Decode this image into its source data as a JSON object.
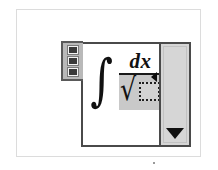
{
  "window": {
    "title": "Equation Editor"
  },
  "frame": {
    "name": "document-frame",
    "background": "#ffffff",
    "border_color": "#dcdcdc"
  },
  "editor": {
    "name": "equation-editor-widget",
    "border_color": "#4a4a4a",
    "background": "#ffffff"
  },
  "handle_toolbar": {
    "name": "handle-toolbar",
    "background": "#b9b9b9",
    "border_color": "#5a5a5a",
    "buttons": [
      {
        "label": "",
        "name": "handle-button-1"
      },
      {
        "label": "",
        "name": "handle-button-2"
      },
      {
        "label": "",
        "name": "handle-button-3"
      }
    ]
  },
  "formula": {
    "name": "formula-expression",
    "latex": "\\int \\frac{dx}{\\sqrt{\\Box}}",
    "integral_symbol": "∫",
    "numerator": "dx",
    "radical_symbol": "√",
    "denominator_placeholder": "",
    "selection_color": "#c9c9c9",
    "placeholder_fill": "#d3d3d3",
    "placeholder_border": "#1f1f1f",
    "text_color": "#111111"
  },
  "scrollbar": {
    "name": "vertical-scrollbar",
    "track_color": "#d6d6d6",
    "border_color": "#4a4a4a",
    "down_arrow_glyph": "▼",
    "position_percent": 100
  },
  "caret": {
    "name": "insertion-caret-marker",
    "glyph": "◀",
    "color": "#0d0d0d"
  }
}
